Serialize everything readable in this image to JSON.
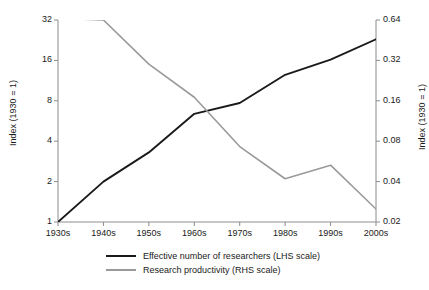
{
  "chart_data": {
    "type": "line",
    "title": "",
    "subtitle": "",
    "xlabel": "",
    "ylabel": "Index (1930 = 1)",
    "y2label": "Index (1930 = 1)",
    "categories": [
      "1930s",
      "1940s",
      "1950s",
      "1960s",
      "1970s",
      "1980s",
      "1990s",
      "2000s"
    ],
    "grid": false,
    "legend_position": "bottom",
    "yscale": "log2",
    "y2scale": "log2",
    "ylim": [
      1,
      32
    ],
    "y2lim": [
      0.02,
      0.64
    ],
    "yticks": [
      "32",
      "16",
      "8",
      "4",
      "2",
      "1"
    ],
    "ytick_values": [
      32,
      16,
      8,
      4,
      2,
      1
    ],
    "y2ticks": [
      "0.64",
      "0.32",
      "0.16",
      "0.08",
      "0.04",
      "0.02"
    ],
    "y2tick_values": [
      0.64,
      0.32,
      0.16,
      0.08,
      0.04,
      0.02
    ],
    "series": [
      {
        "name": "Effective number of researchers (LHS scale)",
        "axis": "left",
        "color": "#1a1a1a",
        "values": [
          1,
          2,
          3.3,
          6.4,
          7.7,
          12.5,
          16.2,
          23
        ]
      },
      {
        "name": "Research productivity (RHS scale)",
        "axis": "right",
        "color": "#9a9a9a",
        "values": [
          0.66,
          0.64,
          0.3,
          0.17,
          0.073,
          0.042,
          0.053,
          0.025
        ]
      }
    ]
  },
  "axis": {
    "left_label": "Index (1930 = 1)",
    "right_label": "Index (1930 = 1)"
  },
  "legend": {
    "items": [
      {
        "label": "Effective number of researchers (LHS scale)"
      },
      {
        "label": "Research productivity (RHS scale)"
      }
    ]
  }
}
